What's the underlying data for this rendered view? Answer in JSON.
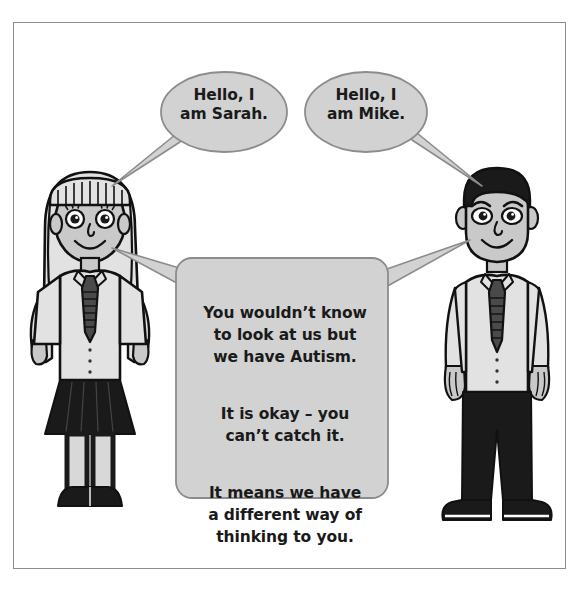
{
  "poster": {
    "title": "Autism awareness illustration",
    "background_color": "#ffffff",
    "frame_border_color": "#8d8d8d"
  },
  "palette": {
    "bubble_fill": "#d2d2d2",
    "bubble_stroke": "#8c8c8c",
    "skin_fill": "#c9c9c9",
    "shirt_fill": "#e2e2e2",
    "dark_fill": "#1a1a1a",
    "outline": "#111111",
    "white": "#ffffff"
  },
  "characters": [
    {
      "name": "sarah",
      "label": "Sarah",
      "side": "left",
      "hair": "long blonde hair with fringe",
      "clothing": "white shirt, dark tie, dark skirt, dark shoes"
    },
    {
      "name": "mike",
      "label": "Mike",
      "side": "right",
      "hair": "short dark hair",
      "clothing": "white shirt, dark tie, dark trousers, dark shoes"
    }
  ],
  "bubbles": {
    "sarah_greeting": {
      "speaker": "Sarah",
      "shape": "ellipse",
      "text": "Hello, I\nam Sarah."
    },
    "mike_greeting": {
      "speaker": "Mike",
      "shape": "ellipse",
      "text": "Hello, I\nam Mike."
    },
    "shared_message": {
      "speaker": "Sarah and Mike",
      "shape": "rounded-rectangle",
      "paragraphs": [
        "You wouldn’t know\nto look at us but\nwe have Autism.",
        "It is okay – you\ncan’t catch it.",
        "It means we have\na different way of\nthinking to you."
      ]
    }
  }
}
